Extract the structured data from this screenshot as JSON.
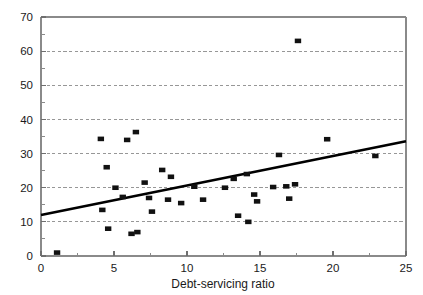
{
  "chart_data": {
    "type": "scatter",
    "title": "",
    "subtitle": "",
    "xlabel": "Debt-servicing ratio",
    "ylabel": "",
    "xlim": [
      0,
      25
    ],
    "ylim": [
      0,
      70
    ],
    "xticks": [
      0,
      5,
      10,
      15,
      20,
      25
    ],
    "xtick_labels": [
      "0",
      "5",
      "10",
      "15",
      "20",
      "25"
    ],
    "xminor_ticks": [
      2.5,
      7.5,
      12.5,
      17.5,
      22.5
    ],
    "yticks": [
      0,
      10,
      20,
      30,
      40,
      50,
      60,
      70
    ],
    "ytick_labels": [
      "0",
      "10",
      "20",
      "30",
      "40",
      "50",
      "60",
      "70"
    ],
    "yminor_ticks": [
      5,
      15,
      25,
      35,
      45,
      55,
      65
    ],
    "grid": "horizontal-dashed",
    "legend": "none",
    "marker": "filled-square",
    "marker_color": "#111111",
    "points": [
      {
        "x": 1.1,
        "y": 1.0
      },
      {
        "x": 4.1,
        "y": 34.3
      },
      {
        "x": 4.2,
        "y": 13.5
      },
      {
        "x": 4.5,
        "y": 26.0
      },
      {
        "x": 4.6,
        "y": 8.0
      },
      {
        "x": 5.1,
        "y": 20.0
      },
      {
        "x": 5.6,
        "y": 17.3
      },
      {
        "x": 5.9,
        "y": 34.0
      },
      {
        "x": 6.2,
        "y": 6.5
      },
      {
        "x": 6.5,
        "y": 36.3
      },
      {
        "x": 6.6,
        "y": 7.0
      },
      {
        "x": 7.1,
        "y": 21.5
      },
      {
        "x": 7.4,
        "y": 17.0
      },
      {
        "x": 7.6,
        "y": 13.0
      },
      {
        "x": 8.3,
        "y": 25.2
      },
      {
        "x": 8.7,
        "y": 16.5
      },
      {
        "x": 8.9,
        "y": 23.2
      },
      {
        "x": 9.6,
        "y": 15.5
      },
      {
        "x": 10.5,
        "y": 20.3
      },
      {
        "x": 11.1,
        "y": 16.5
      },
      {
        "x": 12.6,
        "y": 20.0
      },
      {
        "x": 13.2,
        "y": 22.6
      },
      {
        "x": 13.5,
        "y": 11.8
      },
      {
        "x": 14.1,
        "y": 24.0
      },
      {
        "x": 14.2,
        "y": 10.0
      },
      {
        "x": 14.6,
        "y": 18.0
      },
      {
        "x": 14.8,
        "y": 16.0
      },
      {
        "x": 15.9,
        "y": 20.2
      },
      {
        "x": 16.3,
        "y": 29.6
      },
      {
        "x": 16.8,
        "y": 20.4
      },
      {
        "x": 17.0,
        "y": 16.8
      },
      {
        "x": 17.4,
        "y": 21.0
      },
      {
        "x": 17.6,
        "y": 63.0
      },
      {
        "x": 19.6,
        "y": 34.2
      },
      {
        "x": 22.9,
        "y": 29.3
      }
    ],
    "trend_line": {
      "label": "",
      "x0": 0.0,
      "y0": 12.0,
      "x1": 25.0,
      "y1": 33.6,
      "color": "#000000"
    }
  }
}
